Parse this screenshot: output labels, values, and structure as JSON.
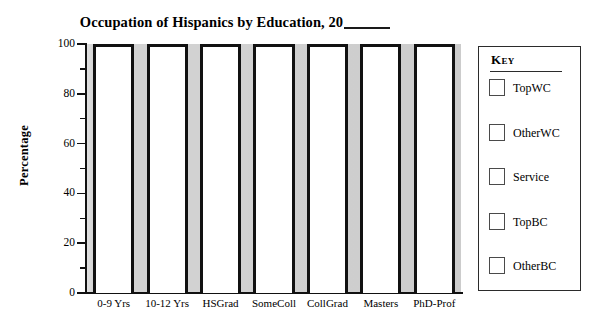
{
  "chart_data": {
    "type": "bar",
    "title_prefix": "Occupation of Hispanics by Education, 20",
    "xlabel": "",
    "ylabel": "Percentage",
    "ylim": [
      0,
      100
    ],
    "ytick_values": [
      0,
      20,
      40,
      60,
      80,
      100
    ],
    "ytick_labels": [
      "0",
      "20",
      "40",
      "60",
      "80",
      "100"
    ],
    "yminor_values": [
      10,
      30,
      50,
      70,
      90
    ],
    "grid": false,
    "legend_position": "right-outside",
    "stacked": true,
    "categories": [
      "0-9 Yrs",
      "10-12 Yrs",
      "HSGrad",
      "SomeColl",
      "CollGrad",
      "Masters",
      "PhD-Prof"
    ],
    "series": [
      {
        "name": "TopWC",
        "color": "#ffffff",
        "values": [
          0,
          0,
          0,
          0,
          0,
          0,
          0
        ]
      },
      {
        "name": "OtherWC",
        "color": "#ffffff",
        "values": [
          0,
          0,
          0,
          0,
          0,
          0,
          0
        ]
      },
      {
        "name": "Service",
        "color": "#ffffff",
        "values": [
          0,
          0,
          0,
          0,
          0,
          0,
          0
        ]
      },
      {
        "name": "TopBC",
        "color": "#ffffff",
        "values": [
          0,
          0,
          0,
          0,
          0,
          0,
          0
        ]
      },
      {
        "name": "OtherBC",
        "color": "#ffffff",
        "values": [
          0,
          0,
          0,
          0,
          0,
          0,
          0
        ]
      }
    ],
    "bar_totals": [
      100,
      100,
      100,
      100,
      100,
      100,
      100
    ]
  },
  "title": {
    "prefix": "Occupation of Hispanics by Education, 20",
    "blank": ""
  },
  "axes": {
    "y_title": "Percentage",
    "y_ticks": [
      {
        "label": "100",
        "value": 100
      },
      {
        "label": "80",
        "value": 80
      },
      {
        "label": "60",
        "value": 60
      },
      {
        "label": "40",
        "value": 40
      },
      {
        "label": "20",
        "value": 20
      },
      {
        "label": "0",
        "value": 0
      }
    ],
    "x_ticks": [
      {
        "label": "0-9 Yrs"
      },
      {
        "label": "10-12 Yrs"
      },
      {
        "label": "HSGrad"
      },
      {
        "label": "SomeColl"
      },
      {
        "label": "CollGrad"
      },
      {
        "label": "Masters"
      },
      {
        "label": "PhD-Prof"
      }
    ]
  },
  "legend": {
    "title": "Key",
    "items": [
      {
        "label": "TopWC"
      },
      {
        "label": "OtherWC"
      },
      {
        "label": "Service"
      },
      {
        "label": "TopBC"
      },
      {
        "label": "OtherBC"
      }
    ]
  },
  "colors": {
    "bar_fill": "#ffffff",
    "bar_outline": "#111111",
    "plot_background": "#d4d4d4",
    "axis": "#111111",
    "legend_border": "#2b2b2b",
    "text": "#000000"
  }
}
